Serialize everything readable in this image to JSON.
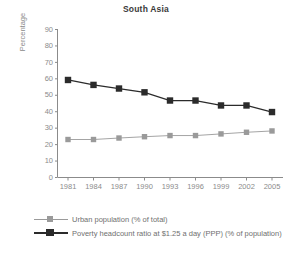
{
  "chart_data": {
    "type": "line",
    "title": "South Asia",
    "xlabel": "",
    "ylabel": "Percentage",
    "ylim": [
      0,
      90
    ],
    "yticks": [
      0,
      10,
      20,
      30,
      40,
      50,
      60,
      70,
      80,
      90
    ],
    "grid": false,
    "legend_position": "bottom-left",
    "categories": [
      "1981",
      "1984",
      "1987",
      "1990",
      "1993",
      "1996",
      "1999",
      "2002",
      "2005"
    ],
    "x": [
      1981,
      1984,
      1987,
      1990,
      1993,
      1996,
      1999,
      2002,
      2005
    ],
    "series": [
      {
        "name": "Urban population (% of total)",
        "color": "#9a9a9a",
        "marker": "square",
        "values": [
          22.8,
          22.8,
          23.7,
          24.5,
          25.2,
          25.2,
          26.2,
          27.2,
          28.0
        ]
      },
      {
        "name": "Poverty headcount ratio at $1.25 a day (PPP) (% of population)",
        "color": "#2b2b2b",
        "marker": "square",
        "values": [
          59.0,
          56.0,
          53.8,
          51.5,
          46.5,
          46.5,
          43.5,
          43.5,
          39.5
        ]
      }
    ]
  },
  "axis": {
    "y_title": "Percentage",
    "y_tick_labels": [
      "90",
      "80",
      "70",
      "60",
      "50",
      "40",
      "30",
      "20",
      "10",
      "0"
    ],
    "x_tick_labels": [
      "1981",
      "1984",
      "1987",
      "1990",
      "1993",
      "1996",
      "1999",
      "2002",
      "2005"
    ]
  },
  "legend": {
    "items": [
      {
        "label": "Urban population (% of total)",
        "color": "#9a9a9a"
      },
      {
        "label": "Poverty headcount ratio at $1.25 a day (PPP) (% of population)",
        "color": "#2b2b2b"
      }
    ]
  },
  "colors": {
    "axis": "#8b8b8b",
    "text": "#6f6f6f",
    "title": "#3a3a3a",
    "series_light": "#9a9a9a",
    "series_dark": "#2b2b2b",
    "background": "#ffffff"
  }
}
